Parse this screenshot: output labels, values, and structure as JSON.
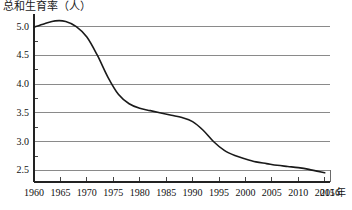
{
  "chart_data": {
    "type": "line",
    "title": "总和生育率（人）",
    "xlabel": "年",
    "ylabel": "",
    "grid": true,
    "legend": false,
    "xlim": [
      1960,
      2016
    ],
    "ylim": [
      2.3,
      5.15
    ],
    "y_ticks": [
      "5.0",
      "4.5",
      "4.0",
      "3.5",
      "3.0",
      "2.5"
    ],
    "y_tick_values": [
      5.0,
      4.5,
      4.0,
      3.5,
      3.0,
      2.5
    ],
    "y_minor_step": 0.25,
    "x_ticks": [
      "1960",
      "1965",
      "1970",
      "1975",
      "1980",
      "1985",
      "1990",
      "1995",
      "2000",
      "2005",
      "2010",
      "2015",
      "2016"
    ],
    "x_tick_values": [
      1960,
      1965,
      1970,
      1975,
      1980,
      1985,
      1990,
      1995,
      2000,
      2005,
      2010,
      2015,
      2016
    ],
    "series": [
      {
        "name": "总和生育率",
        "color": "#1a1a1a",
        "x": [
          1960,
          1962,
          1964,
          1966,
          1968,
          1970,
          1972,
          1974,
          1976,
          1978,
          1980,
          1982,
          1984,
          1986,
          1988,
          1990,
          1992,
          1994,
          1996,
          1998,
          2000,
          2002,
          2004,
          2006,
          2008,
          2010,
          2012,
          2015
        ],
        "values": [
          4.99,
          5.05,
          5.1,
          5.09,
          5.0,
          4.82,
          4.5,
          4.12,
          3.82,
          3.66,
          3.58,
          3.54,
          3.5,
          3.46,
          3.42,
          3.35,
          3.2,
          3.0,
          2.85,
          2.76,
          2.7,
          2.65,
          2.62,
          2.59,
          2.57,
          2.55,
          2.52,
          2.46
        ]
      }
    ]
  },
  "axes_geometry": {
    "plot_left": 34,
    "plot_right": 330,
    "plot_top": 18,
    "plot_bottom": 182
  }
}
